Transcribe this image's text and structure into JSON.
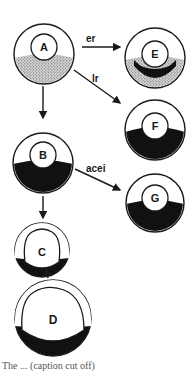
{
  "diagram": {
    "stages": [
      {
        "id": "A",
        "label": "A",
        "fill": "stippled"
      },
      {
        "id": "B",
        "label": "B",
        "fill": "dark"
      },
      {
        "id": "C",
        "label": "C",
        "fill": "dark-rim"
      },
      {
        "id": "D",
        "label": "D",
        "fill": "dark-rim"
      },
      {
        "id": "E",
        "label": "E",
        "fill": "dark-band-stippled"
      },
      {
        "id": "F",
        "label": "F",
        "fill": "dark"
      },
      {
        "id": "G",
        "label": "G",
        "fill": "dark"
      }
    ],
    "edges": [
      {
        "from": "A",
        "to": "E",
        "label": "er"
      },
      {
        "from": "A",
        "to": "F",
        "label": "lr"
      },
      {
        "from": "A",
        "to": "B",
        "label": ""
      },
      {
        "from": "B",
        "to": "G",
        "label": "acei"
      },
      {
        "from": "B",
        "to": "C",
        "label": ""
      },
      {
        "from": "D",
        "to": "C",
        "label": ""
      }
    ],
    "caption": "The ... (caption cut off)",
    "colors": {
      "ink": "#1a1a1a",
      "background": "#ffffff",
      "stipple": "#9a9a9a"
    }
  }
}
